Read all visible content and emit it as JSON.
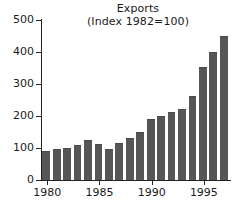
{
  "chart_data": {
    "type": "bar",
    "title": "Exports",
    "subtitle": "(Index 1982=100)",
    "xlabel": "",
    "ylabel": "",
    "ylim": [
      0,
      500
    ],
    "yticks": [
      0,
      100,
      200,
      300,
      400,
      500
    ],
    "xticks": [
      1980,
      1985,
      1990,
      1995
    ],
    "grid": false,
    "legend": false,
    "bar_color": "#565656",
    "axis_color": "#222222",
    "background": "#ffffff",
    "categories": [
      "1980",
      "1981",
      "1982",
      "1983",
      "1984",
      "1985",
      "1986",
      "1987",
      "1988",
      "1989",
      "1990",
      "1991",
      "1992",
      "1993",
      "1994",
      "1995",
      "1996",
      "1997"
    ],
    "values": [
      91,
      97,
      101,
      110,
      124,
      112,
      96,
      117,
      131,
      151,
      191,
      201,
      211,
      221,
      262,
      352,
      401,
      450
    ]
  }
}
